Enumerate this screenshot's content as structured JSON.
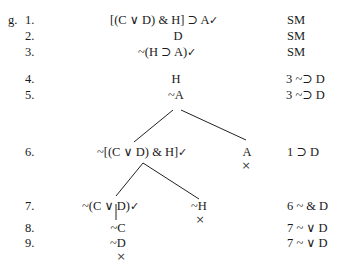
{
  "problem_label": "g.",
  "lines": [
    {
      "num": "1.",
      "formula": "[(C ∨ D) & H] ⊃ A",
      "checked": "✓",
      "just": "SM"
    },
    {
      "num": "2.",
      "formula": "D",
      "just": "SM"
    },
    {
      "num": "3.",
      "formula": "~(H ⊃ A)",
      "checked": "✓",
      "just": "SM"
    },
    {
      "num": "4.",
      "formula": "H",
      "just": "3  ~⊃ D"
    },
    {
      "num": "5.",
      "formula": "~A",
      "just": "3  ~⊃ D"
    },
    {
      "num": "6.",
      "left_formula": "~[(C ∨ D) & H]",
      "left_checked": "✓",
      "right_formula": "A",
      "just": "1  ⊃ D"
    },
    {
      "num": "7.",
      "left_formula": "~(C ∨ D)",
      "left_checked": "✓",
      "right_formula": "~H",
      "just": "6  ~ & D"
    },
    {
      "num": "8.",
      "formula": "~C",
      "just": "7  ~ ∨ D"
    },
    {
      "num": "9.",
      "formula": "~D",
      "just": "7  ~ ∨ D"
    }
  ],
  "closed_marker": "×"
}
